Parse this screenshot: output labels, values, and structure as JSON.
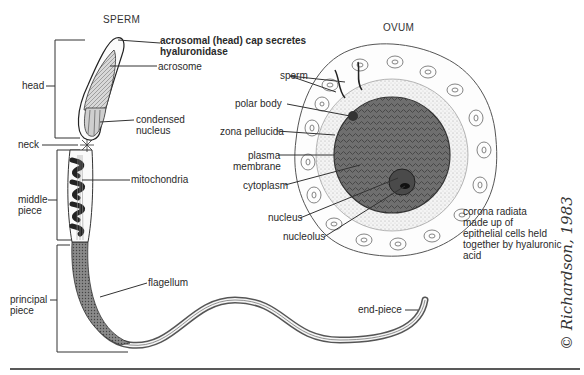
{
  "sperm": {
    "title": "SPERM",
    "regions": {
      "head": "head",
      "neck": "neck",
      "middle_piece": [
        "middle",
        "piece"
      ],
      "principal_piece": [
        "principal",
        "piece"
      ]
    },
    "parts": {
      "cap": [
        "acrosomal (head) cap secretes",
        "hyaluronidase"
      ],
      "acrosome": "acrosome",
      "nucleus": [
        "condensed",
        "nucleus"
      ],
      "mitochondria": "mitochondria",
      "flagellum": "flagellum",
      "end_piece": "end-piece"
    }
  },
  "ovum": {
    "title": "OVUM",
    "labels": {
      "sperm": "sperm",
      "polar_body": "polar body",
      "zona_pellucida": "zona pellucida",
      "plasma_membrane": [
        "plasma",
        "membrane"
      ],
      "cytoplasm": "cytoplasm",
      "nucleus": "nucleus",
      "nucleolus": "nucleolus",
      "corona_radiata": [
        "corona radiata",
        "made up of",
        "epithelial cells held",
        "together by hyaluronic",
        "acid"
      ]
    }
  },
  "signature": "© Richardson, 1983",
  "colors": {
    "ink": "#2a2a2a",
    "cytoplasm": "#6f6f6f",
    "zona": "#f1f1f1",
    "background": "#ffffff"
  }
}
